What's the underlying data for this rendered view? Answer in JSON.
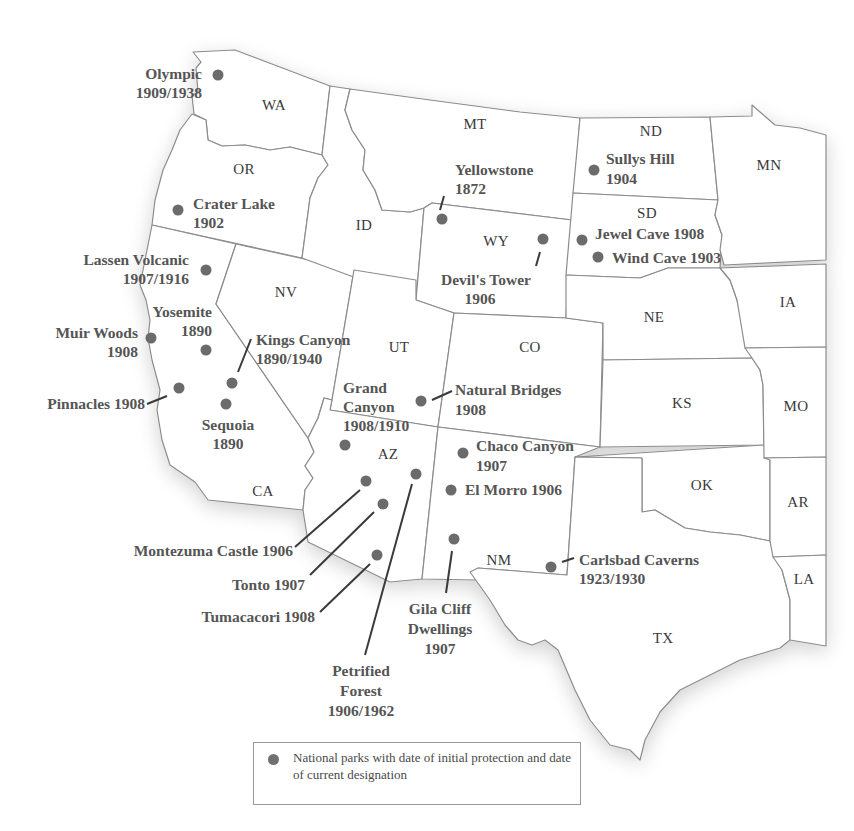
{
  "map": {
    "region": "Western United States",
    "colors": {
      "state_fill": "#ffffff",
      "state_border": "#8c8c8c",
      "park_dot": "#6b6b6b",
      "label_text": "#555555"
    }
  },
  "states": [
    {
      "abbr": "WA"
    },
    {
      "abbr": "OR"
    },
    {
      "abbr": "CA"
    },
    {
      "abbr": "ID"
    },
    {
      "abbr": "NV"
    },
    {
      "abbr": "MT"
    },
    {
      "abbr": "WY"
    },
    {
      "abbr": "UT"
    },
    {
      "abbr": "AZ"
    },
    {
      "abbr": "CO"
    },
    {
      "abbr": "NM"
    },
    {
      "abbr": "ND"
    },
    {
      "abbr": "SD"
    },
    {
      "abbr": "NE"
    },
    {
      "abbr": "KS"
    },
    {
      "abbr": "OK"
    },
    {
      "abbr": "TX"
    },
    {
      "abbr": "MN"
    },
    {
      "abbr": "IA"
    },
    {
      "abbr": "MO"
    },
    {
      "abbr": "AR"
    },
    {
      "abbr": "LA"
    }
  ],
  "parks": [
    {
      "name": "Olympic",
      "dates": "1909/1938"
    },
    {
      "name": "Crater Lake",
      "dates": "1902"
    },
    {
      "name": "Lassen Volcanic",
      "dates": "1907/1916"
    },
    {
      "name": "Yosemite",
      "dates": "1890"
    },
    {
      "name": "Muir Woods",
      "dates": "1908"
    },
    {
      "name": "Kings Canyon",
      "dates": "1890/1940"
    },
    {
      "name": "Pinnacles",
      "dates": "1908"
    },
    {
      "name": "Sequoia",
      "dates": "1890"
    },
    {
      "name": "Grand Canyon",
      "dates": "1908/1910"
    },
    {
      "name": "Yellowstone",
      "dates": "1872"
    },
    {
      "name": "Devil's Tower",
      "dates": "1906"
    },
    {
      "name": "Sullys Hill",
      "dates": "1904"
    },
    {
      "name": "Jewel Cave",
      "dates": "1908"
    },
    {
      "name": "Wind Cave",
      "dates": "1903"
    },
    {
      "name": "Natural Bridges",
      "dates": "1908"
    },
    {
      "name": "Chaco Canyon",
      "dates": "1907"
    },
    {
      "name": "El Morro",
      "dates": "1906"
    },
    {
      "name": "Montezuma Castle",
      "dates": "1906"
    },
    {
      "name": "Tonto",
      "dates": "1907"
    },
    {
      "name": "Tumacacori",
      "dates": "1908"
    },
    {
      "name": "Petrified Forest",
      "dates": "1906/1962"
    },
    {
      "name": "Gila Cliff Dwellings",
      "dates": "1907"
    },
    {
      "name": "Carlsbad Caverns",
      "dates": "1923/1930"
    }
  ],
  "labels": {
    "olympic_1": "Olympic",
    "olympic_2": "1909/1938",
    "crater_1": "Crater Lake",
    "crater_2": "1902",
    "lassen_1": "Lassen Volcanic",
    "lassen_2": "1907/1916",
    "yosemite_1": "Yosemite",
    "yosemite_2": "1890",
    "muir_1": "Muir Woods",
    "muir_2": "1908",
    "kings_1": "Kings Canyon",
    "kings_2": "1890/1940",
    "pinnacles": "Pinnacles 1908",
    "sequoia_1": "Sequoia",
    "sequoia_2": "1890",
    "grand_1": "Grand",
    "grand_2": "Canyon",
    "grand_3": "1908/1910",
    "yellowstone_1": "Yellowstone",
    "yellowstone_2": "1872",
    "devils_1": "Devil's Tower",
    "devils_2": "1906",
    "sullys_1": "Sullys Hill",
    "sullys_2": "1904",
    "jewel": "Jewel Cave 1908",
    "wind": "Wind Cave 1903",
    "natural_1": "Natural Bridges",
    "natural_2": "1908",
    "chaco_1": "Chaco Canyon",
    "chaco_2": "1907",
    "elmorro": "El Morro 1906",
    "montezuma": "Montezuma Castle 1906",
    "tonto": "Tonto 1907",
    "tumacacori": "Tumacacori 1908",
    "petrified_1": "Petrified",
    "petrified_2": "Forest",
    "petrified_3": "1906/1962",
    "gila_1": "Gila Cliff",
    "gila_2": "Dwellings",
    "gila_3": "1907",
    "carlsbad_1": "Carlsbad Caverns",
    "carlsbad_2": "1923/1930"
  },
  "legend": {
    "text": "National parks with date of initial protection and date of current designation"
  }
}
